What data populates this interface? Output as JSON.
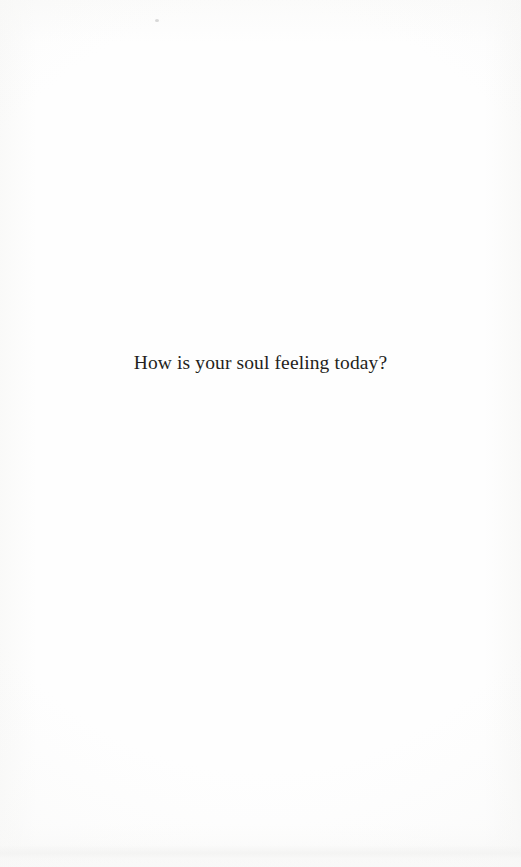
{
  "page": {
    "kind": "scanned-book-page",
    "width": 521,
    "height": 867,
    "background_color": "#fefefe",
    "ink_color": "#241f20"
  },
  "content": {
    "line_1": "How is your soul feeling today?"
  },
  "artifacts": {
    "speck_label": "",
    "scan_band_label": ""
  }
}
